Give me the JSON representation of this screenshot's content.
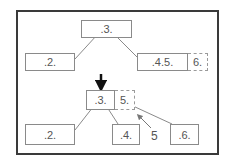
{
  "diagram": {
    "before": {
      "root": ".3.",
      "left_child": ".2.",
      "right_child": ".4.5.",
      "overflow": "6."
    },
    "transition_arrow": "down-arrow",
    "after": {
      "root": ".3.",
      "root_overflow": "5.",
      "left_child": ".2.",
      "middle_child": ".4.",
      "right_child": ".6.",
      "promoted_key_label": "5"
    }
  },
  "colors": {
    "frame": "#3a3a3a",
    "node_border": "#8a8a8a",
    "text": "#555555",
    "line": "#8a8a8a"
  }
}
